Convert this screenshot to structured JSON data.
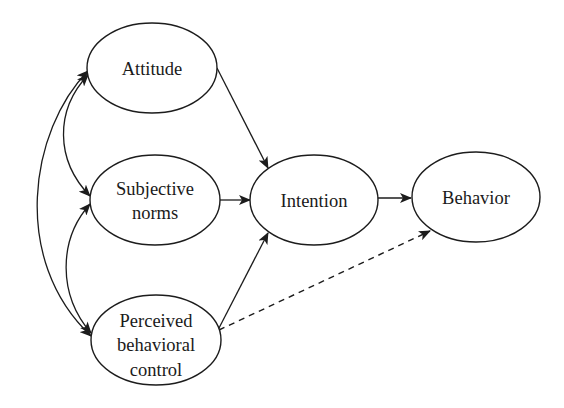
{
  "diagram": {
    "type": "path-model",
    "colors": {
      "stroke": "#1c1c1c",
      "text": "#1a1a1a",
      "background": "#ffffff"
    },
    "nodes": [
      {
        "id": "attitude",
        "label_lines": [
          "Attitude"
        ],
        "cx": 152,
        "cy": 68,
        "rx": 65,
        "ry": 45
      },
      {
        "id": "subjective_norms",
        "label_lines": [
          "Subjective",
          "norms"
        ],
        "cx": 155,
        "cy": 200,
        "rx": 65,
        "ry": 45
      },
      {
        "id": "perceived_behavioral_control",
        "label_lines": [
          "Perceived",
          "behavioral",
          "control"
        ],
        "cx": 156,
        "cy": 340,
        "rx": 65,
        "ry": 45
      },
      {
        "id": "intention",
        "label_lines": [
          "Intention"
        ],
        "cx": 314,
        "cy": 200,
        "rx": 64,
        "ry": 45
      },
      {
        "id": "behavior",
        "label_lines": [
          "Behavior"
        ],
        "cx": 476,
        "cy": 197,
        "rx": 64,
        "ry": 45
      }
    ],
    "edges": [
      {
        "from": "attitude",
        "to": "intention",
        "style": "solid",
        "direction": "forward"
      },
      {
        "from": "subjective_norms",
        "to": "intention",
        "style": "solid",
        "direction": "forward"
      },
      {
        "from": "perceived_behavioral_control",
        "to": "intention",
        "style": "solid",
        "direction": "forward"
      },
      {
        "from": "intention",
        "to": "behavior",
        "style": "solid",
        "direction": "forward"
      },
      {
        "from": "perceived_behavioral_control",
        "to": "behavior",
        "style": "dashed",
        "direction": "forward"
      },
      {
        "from": "attitude",
        "to": "subjective_norms",
        "style": "solid-curved",
        "direction": "both"
      },
      {
        "from": "subjective_norms",
        "to": "perceived_behavioral_control",
        "style": "solid-curved",
        "direction": "both"
      },
      {
        "from": "attitude",
        "to": "perceived_behavioral_control",
        "style": "solid-curved",
        "direction": "both"
      }
    ],
    "labels": {
      "attitude": "Attitude",
      "subjective_norms_1": "Subjective",
      "subjective_norms_2": "norms",
      "pbc_1": "Perceived",
      "pbc_2": "behavioral",
      "pbc_3": "control",
      "intention": "Intention",
      "behavior": "Behavior"
    }
  }
}
